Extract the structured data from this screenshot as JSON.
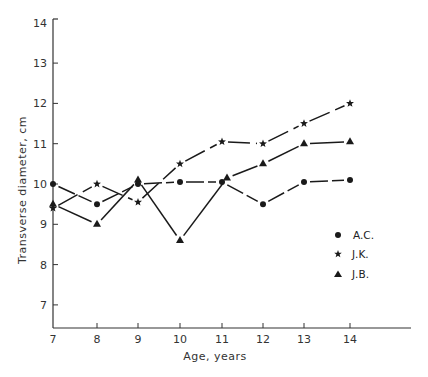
{
  "chart_data": {
    "type": "line",
    "title": "",
    "xlabel": "Age, years",
    "ylabel": "Transverse diameter, cm",
    "x": [
      7,
      8,
      9,
      10,
      11,
      12,
      13,
      14
    ],
    "xticks": [
      "7",
      "8",
      "9",
      "10",
      "11",
      "12",
      "13",
      "14"
    ],
    "yticks": [
      "7",
      "8",
      "9",
      "10",
      "11",
      "12",
      "13",
      "14"
    ],
    "xlim": [
      7,
      15.5
    ],
    "ylim": [
      6.45,
      14
    ],
    "grid": false,
    "legend_position": "right-middle",
    "series": [
      {
        "name": "A.C.",
        "marker": "circle",
        "line_style": "dashed",
        "values": [
          10.0,
          9.5,
          10.0,
          10.05,
          10.05,
          9.5,
          10.05,
          10.1
        ]
      },
      {
        "name": "J.K.",
        "marker": "star",
        "line_style": "long-dash",
        "values": [
          9.4,
          10.0,
          9.55,
          10.5,
          11.05,
          11.0,
          11.5,
          12.0
        ]
      },
      {
        "name": "J.B.",
        "marker": "triangle",
        "line_style": "solid",
        "values": [
          9.5,
          9.0,
          10.1,
          8.6,
          10.15,
          10.5,
          11.0,
          11.05
        ]
      }
    ]
  },
  "legend": {
    "items": [
      {
        "label": "A.C.",
        "marker": "circle"
      },
      {
        "label": "J.K.",
        "marker": "star"
      },
      {
        "label": "J.B.",
        "marker": "triangle"
      }
    ]
  },
  "axes": {
    "x_title": "Age, years",
    "y_title": "Transverse diameter, cm"
  },
  "colors": {
    "ink": "#1a1a1a",
    "background": "#ffffff"
  }
}
